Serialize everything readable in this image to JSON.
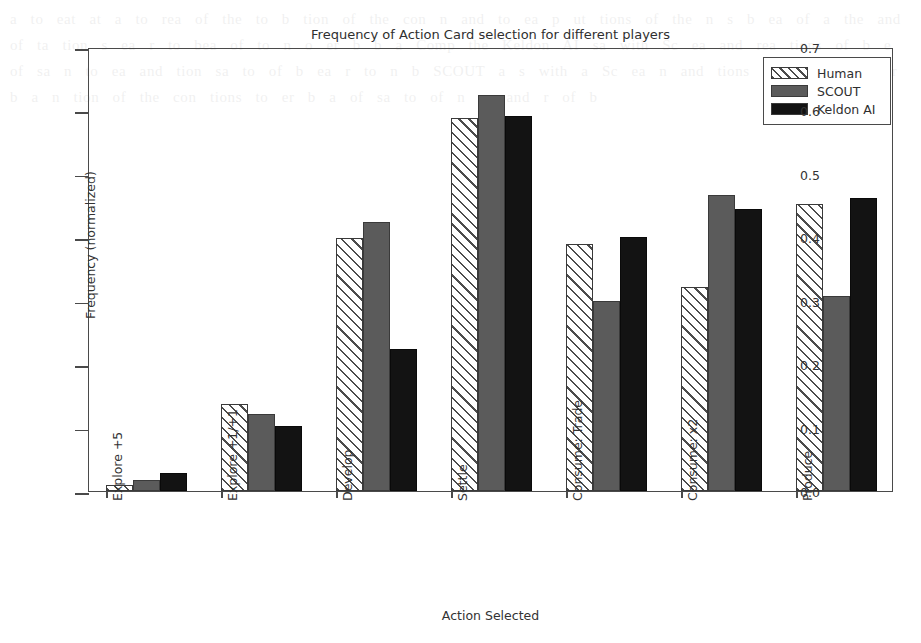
{
  "chart_data": {
    "type": "bar",
    "title": "Frequency of Action Card selection for different players",
    "xlabel": "Action Selected",
    "ylabel": "Frequency (normalized)",
    "ylim": [
      0.0,
      0.7
    ],
    "ytick_labels": [
      "0.0",
      "0.1",
      "0.2",
      "0.3",
      "0.4",
      "0.5",
      "0.6",
      "0.7"
    ],
    "ytick_values": [
      0.0,
      0.1,
      0.2,
      0.3,
      0.4,
      0.5,
      0.6,
      0.7
    ],
    "grid": false,
    "legend_position": "upper right",
    "categories": [
      "Explore +5",
      "Explore +1/+1",
      "Develop",
      "Settle",
      "Consume: Trade",
      "Consume: x2",
      "Produce"
    ],
    "series": [
      {
        "name": "Human",
        "style": "hatched",
        "color": "#ffffff",
        "values": [
          0.01,
          0.137,
          0.399,
          0.588,
          0.39,
          0.322,
          0.452
        ]
      },
      {
        "name": "SCOUT",
        "style": "solid",
        "color": "#5b5b5b",
        "values": [
          0.018,
          0.121,
          0.424,
          0.625,
          0.3,
          0.467,
          0.307
        ]
      },
      {
        "name": "Keldon AI",
        "style": "solid",
        "color": "#131313",
        "values": [
          0.028,
          0.102,
          0.224,
          0.592,
          0.401,
          0.445,
          0.462
        ]
      }
    ]
  },
  "ghost_text": "a to eat at a to rea of the to b tion of the con n and to ea p ut tions of the n s b ea of a the and of ta tion s ea r to bea of to n o er b b a Comp the Keldon AI sa with Sc ea and rea tions of b e of sa n to ea and tion sa to of b ea r to n b SCOUT a s with a Sc ea n and tions of b to a to er b a n tion of the con tions to er b a of sa to of n ea and r of b"
}
